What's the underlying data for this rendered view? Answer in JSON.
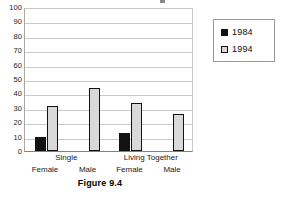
{
  "caption": "Figure 9.4",
  "legend": {
    "position": "right",
    "entries": [
      {
        "label": "1984",
        "swatch": "black-square-icon",
        "color": "#121212"
      },
      {
        "label": "1994",
        "swatch": "light-gray-square-icon",
        "color": "#d9d9d9"
      }
    ]
  },
  "axis": {
    "y_ticks": [
      "100",
      "90",
      "80",
      "70",
      "60",
      "50",
      "40",
      "30",
      "20",
      "10",
      "0"
    ]
  },
  "x_axis_labels": {
    "groups": [
      "Single",
      "Living Together"
    ],
    "subs": [
      "Female",
      "Male",
      "Female",
      "Male"
    ]
  },
  "chart_data": {
    "type": "bar",
    "title": "",
    "xlabel": "",
    "ylabel": "",
    "ylim": [
      0,
      100
    ],
    "ytick_step": 10,
    "grid": true,
    "legend_position": "right",
    "categories": [
      "Single Female",
      "Single Male",
      "Living Together Female",
      "Living Together Male"
    ],
    "category_groups": [
      "Single",
      "Single",
      "Living Together",
      "Living Together"
    ],
    "category_subs": [
      "Female",
      "Male",
      "Female",
      "Male"
    ],
    "series": [
      {
        "name": "1984",
        "color": "#121212",
        "values": [
          10,
          null,
          12.5,
          null
        ]
      },
      {
        "name": "1994",
        "color": "#d9d9d9",
        "values": [
          31.5,
          44,
          33.5,
          26
        ]
      }
    ]
  }
}
